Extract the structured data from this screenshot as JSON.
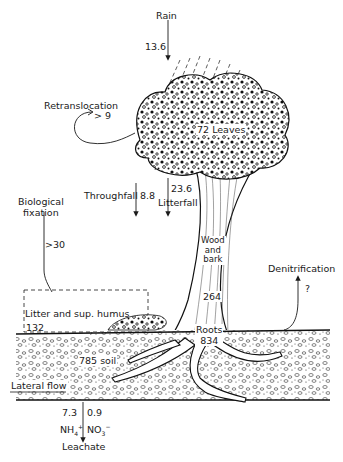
{
  "diagram": {
    "type": "nitrogen-cycle-forest-ecosystem",
    "colors": {
      "ink": "#1a1a1a",
      "background": "#ffffff"
    },
    "labels": {
      "rain": "Rain",
      "rain_value": "13.6",
      "retranslocation": "Retranslocation",
      "retranslocation_value": "> 9",
      "leaves_value": "72",
      "leaves": "Leaves",
      "throughfall": "Throughfall",
      "throughfall_value": "8.8",
      "litterfall_value": "23.6",
      "litterfall": "Litterfall",
      "biological_fixation_line1": "Biological",
      "biological_fixation_line2": "fixation",
      "biological_fixation_value": ">30",
      "wood_line1": "Wood",
      "wood_line2": "and",
      "wood_line3": "bark",
      "wood_value": "264",
      "denitrification": "Denitrification",
      "denitrification_value": "?",
      "litter_humus": "Litter and sup. humus",
      "litter_humus_value": "132",
      "roots": "Roots",
      "roots_value": "834",
      "soil": "785 soil",
      "lateral_flow": "Lateral flow",
      "nh4_value": "7.3",
      "no3_value": "0.9",
      "nh4": "NH",
      "nh4_sub": "4",
      "nh4_sup": "+",
      "no3": "NO",
      "no3_sub": "3",
      "no3_sup": "−",
      "leachate": "Leachate"
    }
  }
}
